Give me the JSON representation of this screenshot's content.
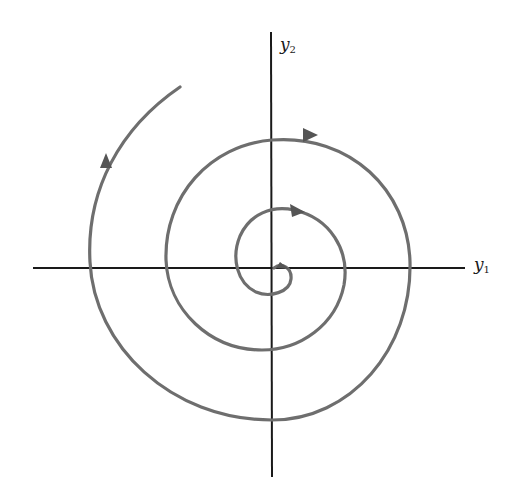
{
  "diagram": {
    "type": "phase-portrait",
    "axes": {
      "horizontal": {
        "label_var": "y",
        "label_sub": "1"
      },
      "vertical": {
        "label_var": "y",
        "label_sub": "2"
      }
    },
    "colors": {
      "background": "#ffffff",
      "axis": "#1a1a1a",
      "trajectory": "#6e6e6e"
    },
    "trajectory": {
      "direction": "clockwise, spiraling outward",
      "arrow_count": 4
    }
  }
}
